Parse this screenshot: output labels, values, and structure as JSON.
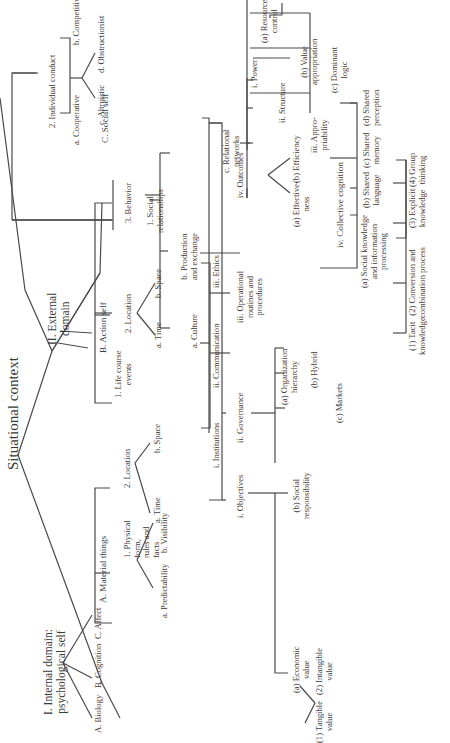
{
  "title": "Situational context",
  "internal": {
    "label": "I. Internal domain:\npsychological self",
    "children": [
      "A. Biology",
      "B. Cognition",
      "C. Affect"
    ]
  },
  "external": {
    "label": "II. External\ndomain",
    "material": {
      "label": "A. Material things",
      "physical": "1. Physical\nform,\nrules and\nfacts",
      "physical_children": [
        "a. Predictability",
        "b. Visibility"
      ],
      "location": "2. Location",
      "location_children": [
        "a. Time",
        "b. Space"
      ]
    },
    "action": {
      "label": "B. Action self",
      "life_course": "1. Life course\nevents",
      "location": "2. Location",
      "location_children": [
        "a. Time",
        "b. Space"
      ],
      "behavior": "3. Behavior"
    },
    "social": {
      "label": "C. Social self",
      "relationships": "1. Social\nrelationships",
      "individual_conduct": "2. Individual conduct",
      "conduct_children": [
        "a. Cooperative",
        "b. Competitive",
        "c. Altruistic",
        "d. Obstructionist"
      ],
      "culture": {
        "label": "a. Culture",
        "children": [
          "i. Institutions",
          "ii. Communication",
          "iii. Ethics"
        ]
      },
      "production": {
        "label": "b. Production\nand exchange",
        "objectives": "i. Objectives",
        "objectives_children": [
          "(a) Economic\nvalue",
          "(b) Social\nresponsibility"
        ],
        "economic_children": [
          "(1) Tangible\nvalue",
          "(2) Intangible\nvalue"
        ],
        "governance": "ii. Governance",
        "governance_children": [
          "(a) Organization\nhierarchy",
          "(b) Hybrid",
          "(c) Markets"
        ],
        "operational": "iii. Operational\nroutines and\nprocedures",
        "outcomes": "iv. Outcomes",
        "outcomes_children": [
          "(a) Effective-\nness",
          "(b) Efficiency"
        ]
      },
      "relational": {
        "label": "c. Relational\nnetworks",
        "power": "i. Power",
        "power_children": [
          "(a) Resource\ncontrol",
          "(b) Value\nappropriation",
          "(c) Dominant\nlogic"
        ],
        "structure": "ii. Structure",
        "appropriability": "iii. Appro-\npriability",
        "collective": "iv. Collective cognition",
        "collective_children": [
          "(a) Social knowledge\nand information\nprocessing",
          "(b) Shared\nlanguage",
          "(c) Shared\nmemory",
          "(d) Shared\nperception"
        ],
        "knowledge_children": [
          "(1) Tacit\nknowledge",
          "(2) Conversion and\ncombination process",
          "(3) Explicit\nknowledge",
          "(4) Group\nthinking"
        ]
      }
    }
  }
}
